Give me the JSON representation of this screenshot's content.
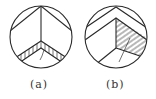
{
  "figure": {
    "panels": [
      {
        "id": "a",
        "label": "(a)",
        "shape": "circle",
        "center": [
          41,
          37
        ],
        "radius": 31,
        "features": [
          "vertical divider from top apex to center",
          "top chevron lines from apex to circle edge",
          "lower hatched chevron band with vertical hatching",
          "small crack line in lower chevron"
        ]
      },
      {
        "id": "b",
        "label": "(b)",
        "shape": "circle",
        "center": [
          116,
          37
        ],
        "radius": 31,
        "features": [
          "double chevron near top",
          "vertical divider from inner apex to center",
          "right region diagonally hatched",
          "lines from center to lower-left and lower-right",
          "diagonal crack line crossing center"
        ]
      }
    ],
    "stroke_color": "#2a2a2a",
    "background_color": "#ffffff"
  }
}
